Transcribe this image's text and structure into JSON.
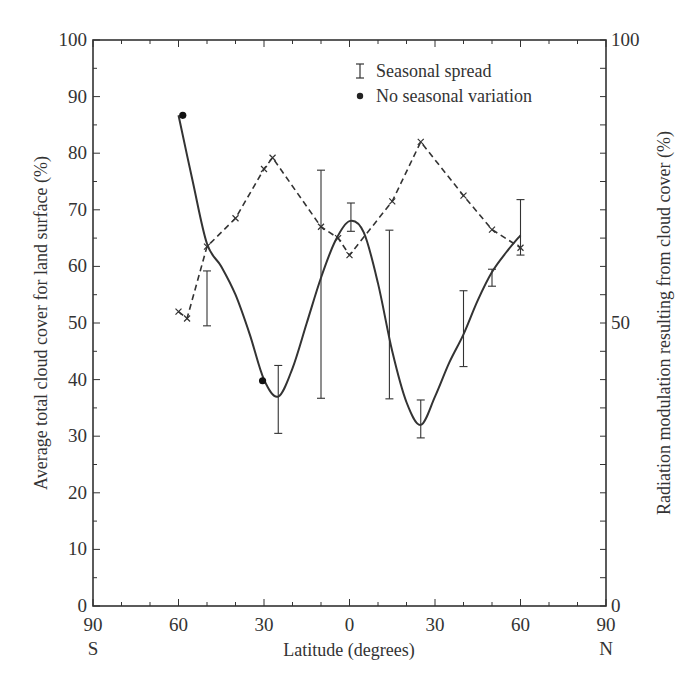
{
  "chart_data": {
    "type": "line",
    "title": "",
    "xlabel": "Latitude (degrees)",
    "ylabel_left": "Average total cloud cover for land surface (%)",
    "ylabel_right": "Radiation modulation resulting from cloud cover (%)",
    "x_range": [
      -90,
      90
    ],
    "ylim_left": [
      0,
      100
    ],
    "ylim_right": [
      0,
      100
    ],
    "x_tick_labels": [
      "90",
      "60",
      "30",
      "0",
      "30",
      "60",
      "90"
    ],
    "x_tick_values": [
      -90,
      -60,
      -30,
      0,
      30,
      60,
      90
    ],
    "x_hemisphere_labels": {
      "south": "S",
      "north": "N"
    },
    "y_left_tick_labels": [
      "0",
      "10",
      "20",
      "30",
      "40",
      "50",
      "60",
      "70",
      "80",
      "90",
      "100"
    ],
    "y_right_tick_labels": [
      "0",
      "50",
      "100"
    ],
    "grid": false,
    "legend_position": "upper-center",
    "legend": [
      {
        "symbol": "error-bar",
        "label": "Seasonal spread"
      },
      {
        "symbol": "filled-dot",
        "label": "No seasonal variation"
      }
    ],
    "series": [
      {
        "name": "Average total cloud cover (solid line)",
        "axis": "left",
        "style": "solid",
        "x": [
          -60,
          -55,
          -50,
          -45,
          -40,
          -35,
          -30,
          -25,
          -20,
          -15,
          -10,
          -5,
          0,
          5,
          10,
          15,
          20,
          25,
          30,
          35,
          40,
          45,
          50,
          55,
          60
        ],
        "values": [
          86.7,
          75,
          64,
          60,
          55,
          48,
          40,
          37,
          42,
          50,
          58,
          64.5,
          68,
          66,
          57,
          45,
          36,
          32,
          37,
          43,
          48,
          54,
          59,
          62.5,
          65.5
        ]
      },
      {
        "name": "Radiation modulation (dashed line)",
        "axis": "right",
        "style": "dashed",
        "marker": "x",
        "x": [
          -60,
          -57,
          -50,
          -40,
          -30,
          -27,
          -10,
          -4,
          0,
          15,
          25,
          40,
          50,
          60
        ],
        "values": [
          52,
          50.8,
          63.5,
          68.5,
          77.2,
          79.2,
          67,
          65,
          62,
          71.5,
          82,
          72.5,
          66.5,
          63.3
        ]
      }
    ],
    "error_bars": {
      "label": "Seasonal spread",
      "items": [
        {
          "x": -50,
          "low": 49.5,
          "high": 59.2
        },
        {
          "x": -25,
          "low": 30.5,
          "high": 42.5
        },
        {
          "x": -10,
          "low": 36.7,
          "high": 77
        },
        {
          "x": 0.5,
          "low": 66.2,
          "high": 71.2
        },
        {
          "x": 14,
          "low": 36.6,
          "high": 66.4
        },
        {
          "x": 25,
          "low": 29.7,
          "high": 36.4
        },
        {
          "x": 40,
          "low": 42.3,
          "high": 55.7
        },
        {
          "x": 50,
          "low": 56.5,
          "high": 59.5
        },
        {
          "x": 60,
          "low": 62,
          "high": 71.8
        }
      ]
    },
    "no_seasonal_variation_points": [
      {
        "x": -58.5,
        "y": 86.7
      },
      {
        "x": -30.5,
        "y": 39.8
      }
    ]
  },
  "colors": {
    "ink": "#333333",
    "background": "#ffffff"
  }
}
